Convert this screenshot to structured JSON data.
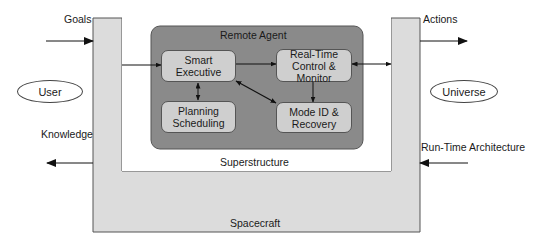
{
  "diagram": {
    "outer_container": {
      "label": "Spacecraft",
      "fill": "#dcdcdc"
    },
    "inner_container": {
      "label": "Superstructure",
      "fill": "#ffffff"
    },
    "agent_group": {
      "label": "Remote Agent",
      "fill": "#8a8a8a"
    },
    "modules": [
      {
        "id": "smart-executive",
        "line1": "Smart",
        "line2": "Executive"
      },
      {
        "id": "real-time-control",
        "line1": "Real-Time",
        "line2": "Control &",
        "line3": "Monitor"
      },
      {
        "id": "planning-scheduling",
        "line1": "Planning",
        "line2": "Scheduling"
      },
      {
        "id": "mode-id-recovery",
        "line1": "Mode ID &",
        "line2": "Recovery"
      }
    ],
    "external_entities": [
      {
        "id": "user",
        "label": "User"
      },
      {
        "id": "universe",
        "label": "Universe"
      }
    ],
    "flows": {
      "goals": "Goals",
      "knowledge": "Knowledge",
      "actions": "Actions",
      "runtime_architecture": "Run-Time Architecture"
    },
    "module_fill": "#cfcfcf"
  }
}
